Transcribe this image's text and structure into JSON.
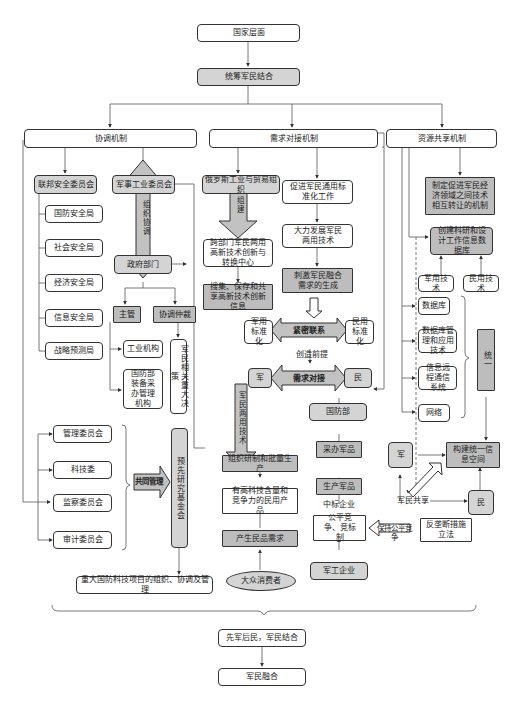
{
  "top": {
    "national_level": "国家层面",
    "overall_planning": "统筹军民结合"
  },
  "coordination": {
    "title": "协调机制",
    "federal_security_council": "联邦安全委员会",
    "security_bureaus": [
      "国防安全局",
      "社会安全局",
      "经济安全局",
      "信息安全局",
      "战略预测局"
    ],
    "military_industry_commission": "军事工业委员会",
    "org_coordination_arrow": "组织协调",
    "government_departments": "政府部门",
    "supervision": "主管",
    "coordination_arbitration": "协调仲裁",
    "industrial_agencies": "工业机构",
    "mod_procurement": "国防部装备采办管理机构",
    "major_decisions": "军民相关重大决策",
    "committees": [
      "管理委员会",
      "科技委",
      "监察委员会",
      "审计委员会"
    ],
    "joint_management": "共同管理",
    "advanced_research_fund": "预先研究基金会",
    "major_projects": "重大国防科技项目的组织、协调及管理"
  },
  "demand": {
    "title": "需求对接机制",
    "russian_trade_org": "俄罗斯工业与贸易组织",
    "build_arrow": "组建",
    "innovation_center": "跨部门军民两用高新技术创新与转换中心",
    "collect_info": "搜集、保存和共享高新技术创新信息",
    "promote_standardization": "促进军民通用标准化工作",
    "develop_dual_use": "大力发展军民两用技术",
    "stimulate_demand": "刺激军民融合需求的生成",
    "military_standard": "军用标准化",
    "close_link": "紧密联系",
    "civil_standard": "民用标准化",
    "create_premise": "创造前提",
    "military": "军",
    "demand_docking": "需求对接",
    "civil": "民",
    "dual_use_tech_arrow": "军民两用技术",
    "organize_production": "组织研制和批量生产",
    "high_tech_products": "有高科技含量和竞争力的民用产品",
    "civil_demand": "产生民品需求",
    "consumers": "大众消费者",
    "mod": "国防部",
    "procure": "采办军品",
    "produce": "生产军品",
    "winning_bidder": "中标企业",
    "fair_competition": "公平竞争、竞标制",
    "keep_fair": "保持公平竞争",
    "anti_monopoly": "反垄断措施立法",
    "military_enterprises": "军工企业"
  },
  "resource": {
    "title": "资源共享机制",
    "mechanism": "制定促进军民经济领域之间技术相互转让的机制",
    "database_create": "创建科研和设计工作信息数据库",
    "military_tech": "军用技术",
    "civil_tech": "民用技术",
    "items": [
      "数据库",
      "数据库管理和应用技术",
      "信息远程通信系统",
      "网络"
    ],
    "unify": "统一",
    "military": "军",
    "unified_space": "构建统一信息空间",
    "shared": "军民共享",
    "civil": "民"
  },
  "bottom": {
    "principle": "先军后民，军民结合",
    "integration": "军民融合"
  }
}
